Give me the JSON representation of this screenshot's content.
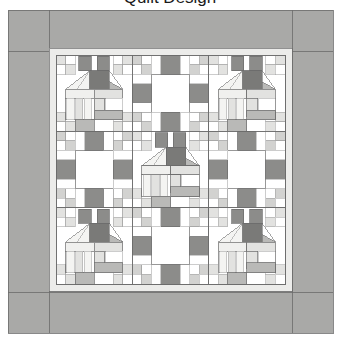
{
  "document": {
    "type": "quilt-pattern-diagram",
    "title_partial": "Quilt Design",
    "description": "Schoolhouse / house block quilt layout with five house blocks arranged in a quincunx on a pieced nine-patch field, framed by a light inner border and a solid gray outer border."
  },
  "canvas": {
    "width": 340,
    "height": 343,
    "background": "#ffffff"
  },
  "palette": {
    "background": "#ffffff",
    "white": "#ffffff",
    "off_white": "#f4f4f2",
    "light_gray": "#e2e2e0",
    "pale_gray": "#d2d2d0",
    "mid_gray": "#b9b9b7",
    "border_gray": "#a9a9a7",
    "dark_gray": "#8c8c8a",
    "darkest_gray": "#7a7a78",
    "line": "#6b6b6b",
    "line_soft": "#9a9a9a"
  },
  "layout": {
    "outer_margin": {
      "label": "paper-margin",
      "inset": 8
    },
    "outer_border": {
      "label": "outer-border",
      "x": 8,
      "y": 10,
      "w": 325,
      "h": 323,
      "fill": "#a9a9a7",
      "width_px": 41
    },
    "corner_squares": {
      "label": "border-corner-squares",
      "size": 41,
      "count": 4
    },
    "inner_border": {
      "label": "inner-border",
      "x": 49,
      "y": 48,
      "w": 243,
      "h": 243,
      "fill": "#ececea",
      "width_px": 7
    },
    "quilt_field": {
      "label": "quilt-field",
      "x": 56,
      "y": 55,
      "w": 229,
      "h": 229,
      "fill": "#ffffff"
    },
    "grid": {
      "blocks_across": 3,
      "blocks_down": 3,
      "block_size_px": 76.33,
      "unit_px": 9.54,
      "units_per_block": 8
    }
  },
  "blocks": {
    "house": {
      "name": "schoolhouse-block",
      "count": 5,
      "positions": [
        {
          "row": 0,
          "col": 0
        },
        {
          "row": 0,
          "col": 2
        },
        {
          "row": 1,
          "col": 1
        },
        {
          "row": 2,
          "col": 0
        },
        {
          "row": 2,
          "col": 2
        }
      ],
      "parts": [
        {
          "part": "left-chimney",
          "fill": "#8c8c8a"
        },
        {
          "part": "right-chimney",
          "fill": "#8c8c8a"
        },
        {
          "part": "roof-left-triangle",
          "fill": "#f4f4f2"
        },
        {
          "part": "roof-peak-triangle",
          "fill": "#7a7a78"
        },
        {
          "part": "roof-right-slope",
          "fill": "#b9b9b7"
        },
        {
          "part": "gable-block",
          "fill": "#8c8c8a"
        },
        {
          "part": "eave-band",
          "fill": "#e6e6e4"
        },
        {
          "part": "door",
          "fill": "#e2e2e0"
        },
        {
          "part": "window-strips",
          "fill": "#f4f4f2"
        },
        {
          "part": "wall-panel",
          "fill": "#b9b9b7"
        },
        {
          "part": "foundation-band",
          "fill": "#b9b9b7"
        }
      ]
    },
    "filler": {
      "name": "nine-patch-filler-block",
      "count": 4,
      "positions": [
        {
          "row": 0,
          "col": 1
        },
        {
          "row": 1,
          "col": 0
        },
        {
          "row": 1,
          "col": 2
        },
        {
          "row": 2,
          "col": 1
        }
      ],
      "parts": [
        {
          "part": "large-plain-square",
          "fill": "#ffffff"
        },
        {
          "part": "corner-accent-square",
          "fill": "#8c8c8a"
        },
        {
          "part": "four-patch-units",
          "fill": "#d2d2d0"
        },
        {
          "part": "sashing-strip",
          "fill": "#ffffff"
        }
      ]
    }
  },
  "legend": {
    "fabrics": [
      {
        "name": "background-white",
        "swatch": "#ffffff"
      },
      {
        "name": "light-print",
        "swatch": "#e2e2e0"
      },
      {
        "name": "medium-print",
        "swatch": "#b9b9b7"
      },
      {
        "name": "dark-print",
        "swatch": "#8c8c8a"
      },
      {
        "name": "border-solid",
        "swatch": "#a9a9a7"
      }
    ]
  }
}
